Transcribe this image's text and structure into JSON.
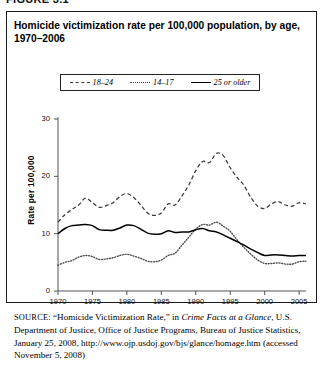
{
  "figure": {
    "label": "FIGURE 3.1"
  },
  "title": "Homicide victimization rate per 100,000 population, by age, 1970–2006",
  "legend": {
    "items": [
      {
        "label": "18–24",
        "style": "dashed",
        "icon": "dashed-line-swatch"
      },
      {
        "label": "14–17",
        "style": "dotted",
        "icon": "dotted-line-swatch"
      },
      {
        "label": "25 or older",
        "style": "solid",
        "icon": "solid-line-swatch"
      }
    ]
  },
  "axes": {
    "ylabel": "Rate per 100,000",
    "yticks": [
      "0",
      "10",
      "20",
      "30"
    ],
    "xticks": [
      "1970",
      "1975",
      "1980",
      "1985",
      "1990",
      "1995",
      "2000",
      "2005"
    ]
  },
  "source": {
    "prefix": "SOURCE",
    "text_1": ": “Homicide Victimization Rate,” in ",
    "italic_1": "Crime Facts at a Glance",
    "text_2": ", U.S. Department of Justice, Office of Justice Programs, Bureau of Justice Statistics, January 25, 2008, http://www.ojp.usdoj.gov/bjs/glance/homage.htm (accessed November 5, 2008)"
  },
  "chart_data": {
    "type": "line",
    "title": "Homicide victimization rate per 100,000 population, by age, 1970–2006",
    "xlabel": "",
    "ylabel": "Rate per 100,000",
    "xlim": [
      1970,
      2006
    ],
    "ylim": [
      0,
      30
    ],
    "grid": false,
    "legend_position": "top-center",
    "x": [
      1970,
      1971,
      1972,
      1973,
      1974,
      1975,
      1976,
      1977,
      1978,
      1979,
      1980,
      1981,
      1982,
      1983,
      1984,
      1985,
      1986,
      1987,
      1988,
      1989,
      1990,
      1991,
      1992,
      1993,
      1994,
      1995,
      1996,
      1997,
      1998,
      1999,
      2000,
      2001,
      2002,
      2003,
      2004,
      2005,
      2006
    ],
    "series": [
      {
        "name": "18–24",
        "style": "dashed",
        "values": [
          12.0,
          13.3,
          14.2,
          15.0,
          16.2,
          15.4,
          14.6,
          14.9,
          15.4,
          16.5,
          17.0,
          16.3,
          15.0,
          13.6,
          13.2,
          13.6,
          15.2,
          15.0,
          16.6,
          18.5,
          21.0,
          22.6,
          22.4,
          24.0,
          23.6,
          21.5,
          19.8,
          18.4,
          16.3,
          14.8,
          14.4,
          15.2,
          15.6,
          15.0,
          14.8,
          15.4,
          15.2
        ]
      },
      {
        "name": "14–17",
        "style": "dotted",
        "values": [
          4.5,
          5.0,
          5.3,
          5.9,
          6.2,
          6.0,
          5.5,
          5.6,
          5.8,
          6.2,
          6.4,
          6.1,
          5.7,
          5.2,
          5.1,
          5.4,
          6.2,
          6.6,
          8.0,
          9.4,
          10.8,
          11.6,
          11.5,
          12.0,
          11.3,
          10.4,
          8.9,
          7.6,
          6.4,
          5.4,
          4.8,
          4.8,
          4.9,
          4.7,
          4.7,
          5.1,
          5.2
        ]
      },
      {
        "name": "25 or older",
        "style": "solid",
        "values": [
          10.0,
          10.9,
          11.4,
          11.5,
          11.6,
          11.4,
          10.7,
          10.6,
          10.6,
          11.0,
          11.5,
          11.4,
          10.8,
          10.1,
          9.9,
          10.0,
          10.5,
          10.2,
          10.3,
          10.3,
          10.7,
          10.9,
          10.5,
          10.3,
          9.8,
          9.2,
          8.6,
          8.0,
          7.3,
          6.7,
          6.2,
          6.3,
          6.3,
          6.2,
          6.1,
          6.2,
          6.2
        ]
      }
    ]
  }
}
